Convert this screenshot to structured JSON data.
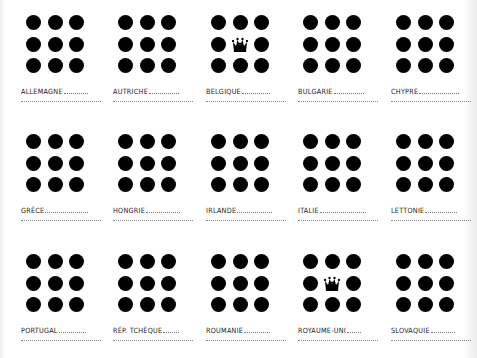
{
  "sheet": {
    "columns_x": [
      21,
      113,
      206,
      298,
      391
    ],
    "rows_y": [
      15,
      134,
      254
    ],
    "dot_color": "#000000",
    "cells": [
      {
        "label": "ALLEMAGNE",
        "crown": false,
        "lead_width": 24
      },
      {
        "label": "AUTRICHE",
        "crown": false,
        "lead_width": 30
      },
      {
        "label": "BELGIQUE",
        "crown": true,
        "lead_width": 28
      },
      {
        "label": "BULGARIE",
        "crown": false,
        "lead_width": 30
      },
      {
        "label": "CHYPRE",
        "crown": false,
        "lead_width": 40
      },
      {
        "label": "GRÈCE",
        "crown": false,
        "lead_width": 43
      },
      {
        "label": "HONGRIE",
        "crown": false,
        "lead_width": 34
      },
      {
        "label": "IRLANDE",
        "crown": false,
        "lead_width": 35
      },
      {
        "label": "ITALIE",
        "crown": false,
        "lead_width": 46
      },
      {
        "label": "LETTONIE",
        "crown": false,
        "lead_width": 32
      },
      {
        "label": "PORTUGAL",
        "crown": false,
        "lead_width": 27
      },
      {
        "label": "RÉP. TCHÈQUE",
        "crown": false,
        "lead_width": 16
      },
      {
        "label": "ROUMANIE",
        "crown": false,
        "lead_width": 26
      },
      {
        "label": "ROYAUME-UNI",
        "crown": true,
        "lead_width": 14
      },
      {
        "label": "SLOVAQUIE",
        "crown": false,
        "lead_width": 24
      }
    ]
  },
  "icons": {
    "dot": "filled-circle",
    "crown": "crown"
  }
}
